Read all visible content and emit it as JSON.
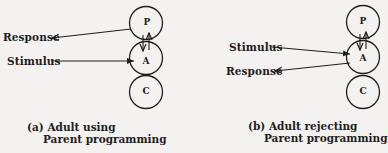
{
  "diagram_a": {
    "nodes": [
      {
        "id": "P",
        "label": "P"
      },
      {
        "id": "A",
        "label": "A"
      },
      {
        "id": "C",
        "label": "C"
      }
    ],
    "labels": {
      "response": "Response",
      "stimulus": "Stimulus"
    },
    "caption": {
      "line1": "(a) Adult using",
      "line2": "Parent programming"
    }
  },
  "diagram_b": {
    "nodes": [
      {
        "id": "P",
        "label": "P"
      },
      {
        "id": "A",
        "label": "A"
      },
      {
        "id": "C",
        "label": "C"
      }
    ],
    "labels": {
      "stimulus": "Stimulus",
      "response": "Response"
    },
    "caption": {
      "line1": "(b) Adult rejecting",
      "line2": "Parent programming"
    }
  },
  "colors": {
    "background": "#f3f2f0",
    "ink": "#1e1e1e"
  }
}
